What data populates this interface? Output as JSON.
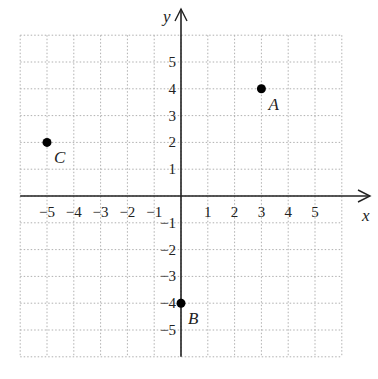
{
  "chart_data": {
    "type": "scatter",
    "title": "",
    "xlabel": "x",
    "ylabel": "y",
    "xlim": [
      -6,
      6
    ],
    "ylim": [
      -6,
      6
    ],
    "grid": true,
    "grid_style": "dotted",
    "x_ticks": [
      "-5",
      "-4",
      "-3",
      "-2",
      "-1",
      "1",
      "2",
      "3",
      "4",
      "5"
    ],
    "y_ticks": [
      "5",
      "4",
      "3",
      "2",
      "1",
      "-1",
      "-2",
      "-3",
      "-4",
      "-5"
    ],
    "points": [
      {
        "label": "A",
        "x": 3,
        "y": 4
      },
      {
        "label": "B",
        "x": 0,
        "y": -4
      },
      {
        "label": "C",
        "x": -5,
        "y": 2
      }
    ]
  },
  "colors": {
    "axis": "#222222",
    "grid": "#b0b0b0",
    "point": "#000000"
  }
}
